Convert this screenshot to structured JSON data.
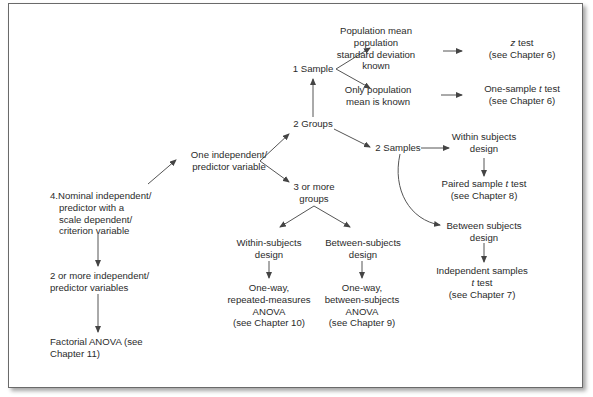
{
  "diagram": {
    "title": "",
    "type": "flowchart",
    "colors": {
      "text": "#2b2b2b",
      "arrow": "#444444",
      "frame": "#6a6a6a",
      "background": "#ffffff"
    },
    "nodes": {
      "root": {
        "lines": [
          "4.Nominal independent/",
          "predictor with a",
          "scale dependent/",
          "criterion variable"
        ]
      },
      "one_iv": {
        "lines": [
          "One independent/",
          "predictor variable"
        ]
      },
      "two_plus_iv": {
        "lines": [
          "2 or more independent/",
          "predictor variables"
        ]
      },
      "factorial": {
        "lines": [
          "Factorial ANOVA (see",
          "Chapter 11)"
        ]
      },
      "two_groups": {
        "lines": [
          "2 Groups"
        ]
      },
      "three_groups": {
        "lines": [
          "3 or more",
          "groups"
        ]
      },
      "one_sample": {
        "lines": [
          "1 Sample"
        ]
      },
      "two_samples": {
        "lines": [
          "2 Samples"
        ]
      },
      "pop_sd_known": {
        "lines": [
          "Population mean",
          "population",
          "standard deviation",
          "known"
        ]
      },
      "only_mean_known": {
        "lines": [
          "Only population",
          "mean is known"
        ]
      },
      "z_test": {
        "lines": [
          "z test",
          "(see Chapter 6)"
        ],
        "italic_prefix": "z"
      },
      "one_sample_t": {
        "lines": [
          "One-sample t test",
          "(see Chapter 6)"
        ],
        "italic_word": "t"
      },
      "within_design_2": {
        "lines": [
          "Within subjects",
          "design"
        ]
      },
      "paired_t": {
        "lines": [
          "Paired sample t test",
          "(see Chapter 8)"
        ],
        "italic_word": "t"
      },
      "between_design_2": {
        "lines": [
          "Between subjects",
          "design"
        ]
      },
      "independent_t": {
        "lines": [
          "Independent samples",
          "t test",
          "(see Chapter 7)"
        ],
        "italic_word": "t"
      },
      "within_design_3": {
        "lines": [
          "Within-subjects",
          "design"
        ]
      },
      "between_design_3": {
        "lines": [
          "Between-subjects",
          "design"
        ]
      },
      "rm_anova": {
        "lines": [
          "One-way,",
          "repeated-measures",
          "ANOVA",
          "(see Chapter 10)"
        ]
      },
      "bs_anova": {
        "lines": [
          "One-way,",
          "between-subjects",
          "ANOVA",
          "(see Chapter 9)"
        ]
      }
    },
    "edges": [
      [
        "root",
        "one_iv"
      ],
      [
        "root",
        "two_plus_iv"
      ],
      [
        "two_plus_iv",
        "factorial"
      ],
      [
        "one_iv",
        "two_groups"
      ],
      [
        "one_iv",
        "three_groups"
      ],
      [
        "two_groups",
        "one_sample"
      ],
      [
        "two_groups",
        "two_samples"
      ],
      [
        "one_sample",
        "pop_sd_known"
      ],
      [
        "one_sample",
        "only_mean_known"
      ],
      [
        "pop_sd_known",
        "z_test"
      ],
      [
        "only_mean_known",
        "one_sample_t"
      ],
      [
        "two_samples",
        "within_design_2"
      ],
      [
        "two_samples",
        "between_design_2"
      ],
      [
        "within_design_2",
        "paired_t"
      ],
      [
        "between_design_2",
        "independent_t"
      ],
      [
        "three_groups",
        "within_design_3"
      ],
      [
        "three_groups",
        "between_design_3"
      ],
      [
        "within_design_3",
        "rm_anova"
      ],
      [
        "between_design_3",
        "bs_anova"
      ]
    ]
  }
}
